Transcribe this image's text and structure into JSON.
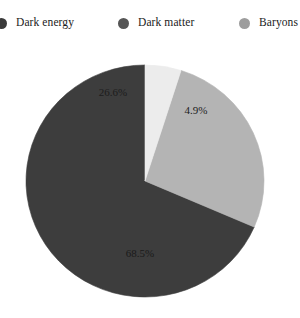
{
  "legend": {
    "position": "top",
    "items": [
      {
        "label": "Dark energy",
        "color": "#3a3a3a",
        "marker": "circle-marker-icon"
      },
      {
        "label": "Dark matter",
        "color": "#555555",
        "marker": "circle-marker-icon"
      },
      {
        "label": "Baryons",
        "color": "#9d9d9d",
        "marker": "circle-marker-icon"
      }
    ]
  },
  "labels": {
    "dark_energy": "68.5%",
    "dark_matter": "26.6%",
    "baryons": "4.9%"
  },
  "chart_data": {
    "type": "pie",
    "title": "",
    "subtitle": "",
    "xlabel": "",
    "ylabel": "",
    "categories": [
      "Dark energy",
      "Dark matter",
      "Baryons"
    ],
    "values": [
      68.5,
      26.6,
      4.9
    ],
    "value_labels": [
      "68.5%",
      "26.6%",
      "4.9%"
    ],
    "colors": [
      "#3d3d3d",
      "#b4b4b4",
      "#ececec"
    ],
    "legend_colors": [
      "#3a3a3a",
      "#555555",
      "#9d9d9d"
    ],
    "units": "percent",
    "total": 100.0,
    "start_angle_deg": 90,
    "direction": "counterclockwise",
    "legend": true,
    "legend_position": "top",
    "grid": false
  }
}
